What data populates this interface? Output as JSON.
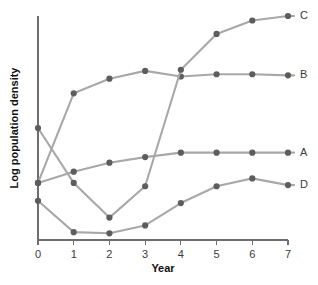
{
  "chart_data": {
    "type": "line",
    "title": "",
    "xlabel": "Year",
    "ylabel": "Log population density",
    "x": [
      0,
      1,
      2,
      3,
      4,
      5,
      6,
      7
    ],
    "xtick_labels": [
      "0",
      "1",
      "2",
      "3",
      "4",
      "5",
      "6",
      "7"
    ],
    "xlim": [
      0,
      7
    ],
    "ylim": [
      0,
      10
    ],
    "ytick_labels": [],
    "grid": false,
    "legend_position": "right-of-line-ends",
    "line_color": "#a8a8a8",
    "marker_color": "#5d5d5d",
    "axis_color": "#6e6e6e",
    "background_color": "#ffffff",
    "series": [
      {
        "name": "A",
        "label": "A",
        "values": [
          2.55,
          3.05,
          3.45,
          3.7,
          3.9,
          3.9,
          3.9,
          3.9
        ]
      },
      {
        "name": "B",
        "label": "B",
        "values": [
          2.55,
          6.55,
          7.2,
          7.55,
          7.3,
          7.4,
          7.4,
          7.35
        ]
      },
      {
        "name": "C",
        "label": "C",
        "values": [
          5.0,
          2.55,
          1.0,
          2.4,
          7.6,
          9.2,
          9.8,
          10.0
        ]
      },
      {
        "name": "D",
        "label": "D",
        "values": [
          1.75,
          0.35,
          0.3,
          0.65,
          1.65,
          2.4,
          2.75,
          2.45
        ]
      }
    ]
  },
  "axis": {
    "x_title": "Year",
    "y_title": "Log population density"
  }
}
